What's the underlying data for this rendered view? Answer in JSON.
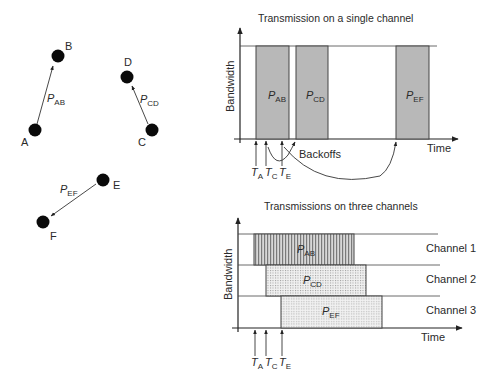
{
  "nodes": [
    {
      "id": "A",
      "label": "A",
      "cx": 35,
      "cy": 130
    },
    {
      "id": "B",
      "label": "B",
      "cx": 58,
      "cy": 56
    },
    {
      "id": "C",
      "label": "C",
      "cx": 152,
      "cy": 130
    },
    {
      "id": "D",
      "label": "D",
      "cx": 127,
      "cy": 77
    },
    {
      "id": "E",
      "label": "E",
      "cx": 103,
      "cy": 180
    },
    {
      "id": "F",
      "label": "F",
      "cx": 43,
      "cy": 222
    }
  ],
  "links": [
    {
      "from": "A",
      "to": "B",
      "label_main": "P",
      "label_sub": "AB"
    },
    {
      "from": "C",
      "to": "D",
      "label_main": "P",
      "label_sub": "CD"
    },
    {
      "from": "E",
      "to": "F",
      "label_main": "P",
      "label_sub": "EF"
    }
  ],
  "single_channel": {
    "title": "Transmission on a single channel",
    "ylabel": "Bandwidth",
    "xlabel": "Time",
    "backoffs_label": "Backoffs",
    "packets": [
      {
        "main": "P",
        "sub": "AB"
      },
      {
        "main": "P",
        "sub": "CD"
      },
      {
        "main": "P",
        "sub": "EF"
      }
    ],
    "times": [
      {
        "main": "T",
        "sub": "A"
      },
      {
        "main": "T",
        "sub": "C"
      },
      {
        "main": "T",
        "sub": "E"
      }
    ]
  },
  "three_channels": {
    "title": "Transmissions on three channels",
    "ylabel": "Bandwidth",
    "xlabel": "Time",
    "channels": [
      "Channel 1",
      "Channel 2",
      "Channel 3"
    ],
    "packets": [
      {
        "main": "P",
        "sub": "AB"
      },
      {
        "main": "P",
        "sub": "CD"
      },
      {
        "main": "P",
        "sub": "EF"
      }
    ],
    "times": [
      {
        "main": "T",
        "sub": "A"
      },
      {
        "main": "T",
        "sub": "C"
      },
      {
        "main": "T",
        "sub": "E"
      }
    ]
  },
  "colors": {
    "bar_fill": "#b8b8b8",
    "node": "#0a0a0a",
    "line": "#333333"
  }
}
